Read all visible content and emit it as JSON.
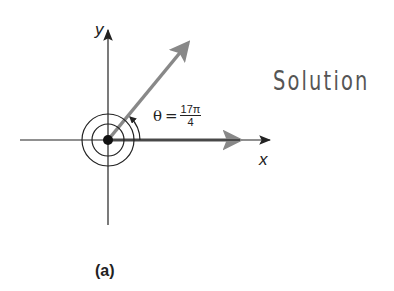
{
  "diagram": {
    "heading": "Solution",
    "caption": "(a)",
    "axes": {
      "x_label": "x",
      "y_label": "y"
    },
    "angle": {
      "symbol": "θ",
      "equals": "=",
      "numerator": "17π",
      "denominator": "4",
      "value_radians": "17π/4",
      "revolutions": 2.125
    },
    "colors": {
      "axes": "#222222",
      "terminal_side": "#888888",
      "text": "#555555"
    }
  }
}
